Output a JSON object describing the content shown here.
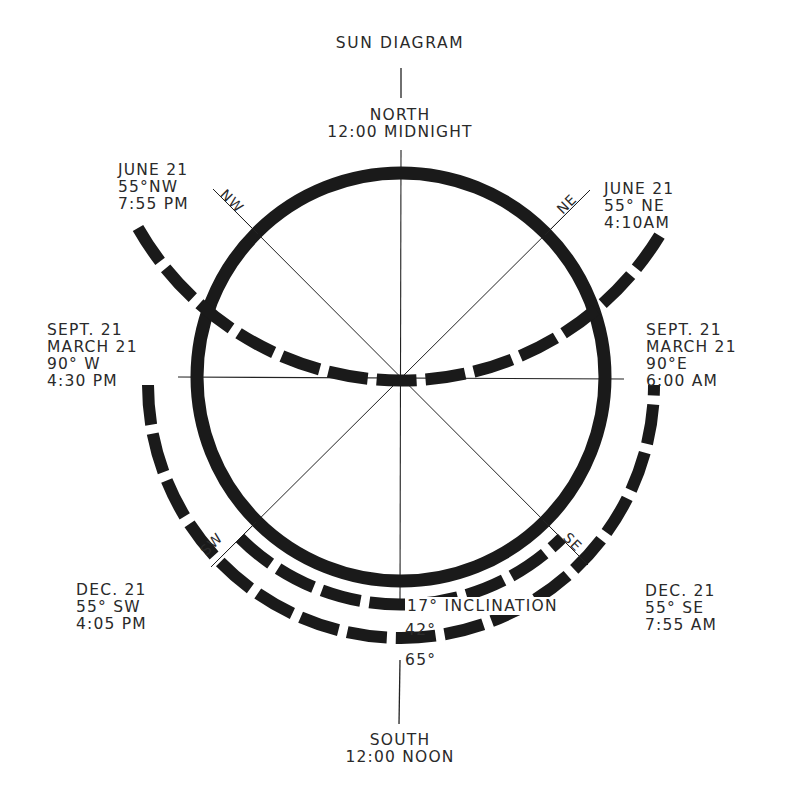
{
  "title": "SUN DIAGRAM",
  "north": {
    "line1": "NORTH",
    "line2": "12:00 MIDNIGHT"
  },
  "south": {
    "line1": "SOUTH",
    "line2": "12:00 NOON"
  },
  "compass": {
    "nw": "NW",
    "ne": "NE",
    "sw": "SW",
    "se": "SE"
  },
  "annotations": {
    "june_nw": {
      "line1": "JUNE 21",
      "line2": "55°NW",
      "line3": "7:55 PM"
    },
    "june_ne": {
      "line1": "JUNE 21",
      "line2": "55° NE",
      "line3": "4:10AM"
    },
    "equinox_w": {
      "line1": "SEPT. 21",
      "line2": "MARCH 21",
      "line3": "90° W",
      "line4": "4:30 PM"
    },
    "equinox_e": {
      "line1": "SEPT. 21",
      "line2": "MARCH 21",
      "line3": "90°E",
      "line4": "6:00 AM"
    },
    "dec_sw": {
      "line1": "DEC. 21",
      "line2": "55° SW",
      "line3": "4:05 PM"
    },
    "dec_se": {
      "line1": "DEC. 21",
      "line2": "55° SE",
      "line3": "7:55 AM"
    }
  },
  "arcs": {
    "inner": {
      "label": "17° INCLINATION",
      "radius": 228
    },
    "middle": {
      "label": "42°",
      "radius": 253
    },
    "outer": {
      "label": "65°",
      "radius": 278
    }
  },
  "colors": {
    "ink": "#1a1a1a",
    "text": "#2a2a2a",
    "background": "#ffffff"
  }
}
